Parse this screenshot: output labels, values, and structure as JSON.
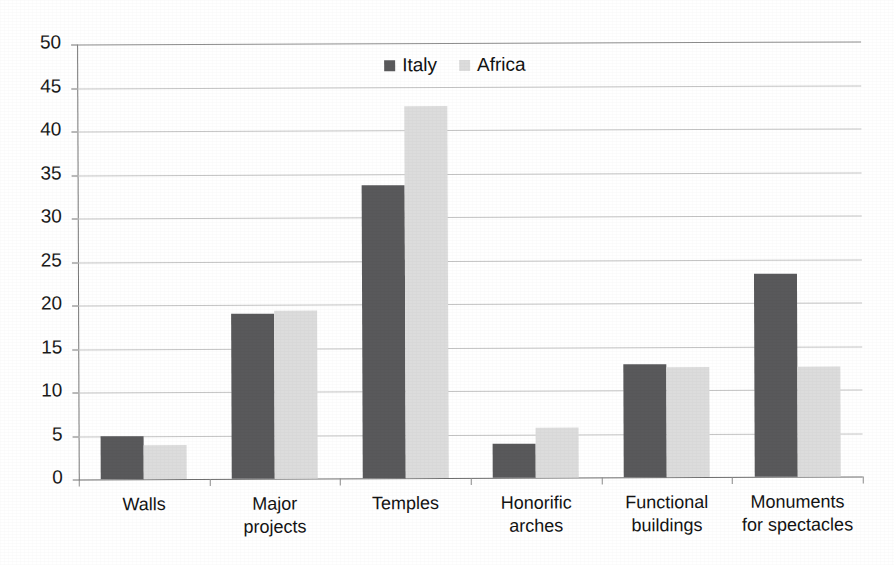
{
  "chart_data": {
    "type": "bar",
    "title": "",
    "subtitle": "",
    "xlabel": "",
    "ylabel": "",
    "ylim": [
      0,
      50
    ],
    "ytick_step": 5,
    "yticks": [
      "50",
      "45",
      "40",
      "35",
      "30",
      "25",
      "20",
      "15",
      "10",
      "5",
      "0"
    ],
    "grid": true,
    "legend_position": "top-center-inside",
    "categories": [
      "Walls",
      "Major\nprojects",
      "Temples",
      "Honorific\narches",
      "Functional\nbuildings",
      "Monuments\nfor spectacles"
    ],
    "series": [
      {
        "name": "Italy",
        "color": "#59595b",
        "values": [
          5.0,
          19.0,
          33.7,
          3.9,
          13.0,
          23.3
        ]
      },
      {
        "name": "Africa",
        "color": "#dcdcdc",
        "values": [
          3.9,
          19.3,
          42.8,
          5.7,
          12.7,
          12.7
        ]
      }
    ]
  },
  "legend": {
    "items": [
      {
        "label": "Italy",
        "swatch": "legend-swatch-italy"
      },
      {
        "label": "Africa",
        "swatch": "legend-swatch-africa"
      }
    ]
  },
  "colors": {
    "italy": "#59595b",
    "africa": "#dcdcdc",
    "gridline": "#c4c4c4",
    "axis": "#777777",
    "text": "#141414",
    "background": "#ffffff"
  }
}
